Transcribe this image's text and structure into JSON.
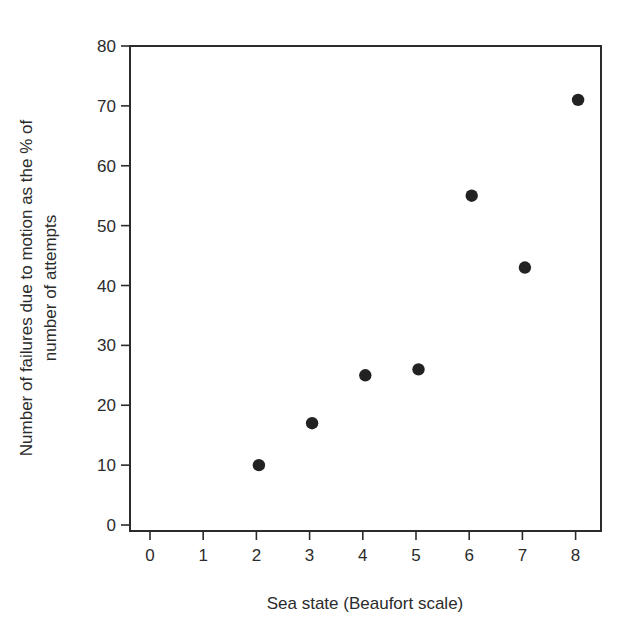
{
  "chart_data": {
    "type": "scatter",
    "title": "",
    "xlabel": "Sea state (Beaufort scale)",
    "ylabel_lines": [
      "Number of failures due to motion as the % of",
      "number of attempts"
    ],
    "ylabel": "Number of failures due to motion as the % of number of attempts",
    "xlim": [
      -0.35,
      8.5
    ],
    "ylim": [
      0,
      80
    ],
    "xticks": [
      0,
      1,
      2,
      3,
      4,
      5,
      6,
      7,
      8
    ],
    "yticks": [
      0,
      10,
      20,
      30,
      40,
      50,
      60,
      70,
      80
    ],
    "grid": false,
    "legend": null,
    "series": [
      {
        "name": "Failures due to motion",
        "marker": "filled-circle",
        "color": "#222222",
        "x": [
          2,
          3,
          4,
          5,
          6,
          7,
          8
        ],
        "y": [
          10,
          17,
          25,
          26,
          55,
          43,
          71
        ]
      }
    ]
  },
  "colors": {
    "axis": "#2b2b2b",
    "marker": "#222222",
    "background": "#ffffff"
  }
}
